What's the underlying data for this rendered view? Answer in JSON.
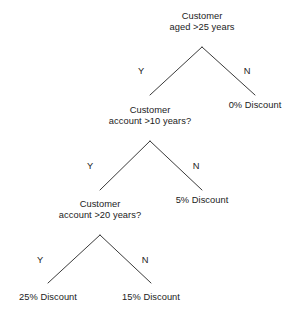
{
  "diagram": {
    "type": "decision-tree",
    "line_color": "#3b3b3b",
    "text_color": "#1b1b1b",
    "background_color": "#ffffff",
    "nodes": [
      {
        "id": "root",
        "line1": "Customer",
        "line2": "aged >25 years"
      },
      {
        "id": "level2",
        "line1": "Customer",
        "line2": "account >10 years?"
      },
      {
        "id": "level3",
        "line1": "Customer",
        "line2": "account >20 years?"
      }
    ],
    "leaves": [
      {
        "id": "leaf-0pct",
        "label": "0% Discount"
      },
      {
        "id": "leaf-5pct",
        "label": "5% Discount"
      },
      {
        "id": "leaf-25pct",
        "label": "25% Discount"
      },
      {
        "id": "leaf-15pct",
        "label": "15% Discount"
      }
    ],
    "branch_labels": {
      "root_yes": "Y",
      "root_no": "N",
      "level2_yes": "Y",
      "level2_no": "N",
      "level3_yes": "Y",
      "level3_no": "N"
    }
  }
}
